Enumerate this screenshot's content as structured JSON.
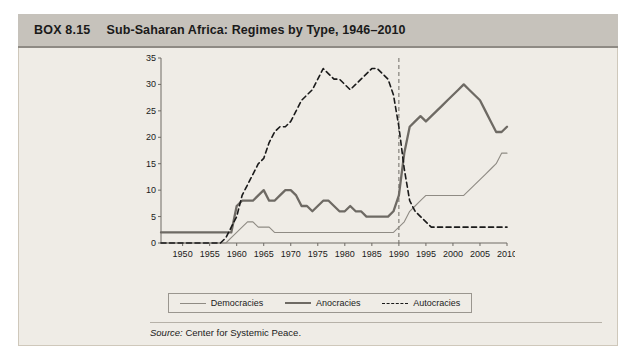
{
  "box": {
    "number": "BOX 8.15",
    "title": "Sub-Saharan Africa: Regimes by Type, 1946–2010"
  },
  "source": {
    "label": "Source:",
    "text": "Center for  Systemic Peace."
  },
  "legend": {
    "items": [
      {
        "label": "Democracies",
        "style": "thin-solid",
        "color": "#8f8b84"
      },
      {
        "label": "Anocracies",
        "style": "thick-solid",
        "color": "#6e6a64"
      },
      {
        "label": "Autocracies",
        "style": "dashed",
        "color": "#1a1a1a"
      }
    ]
  },
  "chart_data": {
    "type": "line",
    "title": "Sub-Saharan Africa: Regimes by Type, 1946–2010",
    "xlabel": "",
    "ylabel": "",
    "xlim": [
      1946,
      2010
    ],
    "ylim": [
      0,
      35
    ],
    "yticks": [
      0,
      5,
      10,
      15,
      20,
      25,
      30,
      35
    ],
    "xticks": [
      1950,
      1955,
      1960,
      1965,
      1970,
      1975,
      1980,
      1985,
      1990,
      1995,
      2000,
      2005,
      2010
    ],
    "grid": false,
    "legend_position": "bottom",
    "annotations": [
      {
        "type": "vertical-line",
        "x": 1990,
        "style": "dashed",
        "color": "#6e6a64"
      }
    ],
    "x": [
      1946,
      1947,
      1948,
      1949,
      1950,
      1951,
      1952,
      1953,
      1954,
      1955,
      1956,
      1957,
      1958,
      1959,
      1960,
      1961,
      1962,
      1963,
      1964,
      1965,
      1966,
      1967,
      1968,
      1969,
      1970,
      1971,
      1972,
      1973,
      1974,
      1975,
      1976,
      1977,
      1978,
      1979,
      1980,
      1981,
      1982,
      1983,
      1984,
      1985,
      1986,
      1987,
      1988,
      1989,
      1990,
      1991,
      1992,
      1993,
      1994,
      1995,
      1996,
      1997,
      1998,
      1999,
      2000,
      2001,
      2002,
      2003,
      2004,
      2005,
      2006,
      2007,
      2008,
      2009,
      2010
    ],
    "series": [
      {
        "name": "Democracies",
        "color": "#8f8b84",
        "style": "thin-solid",
        "values": [
          0,
          0,
          0,
          0,
          0,
          0,
          0,
          0,
          0,
          0,
          0,
          0,
          0,
          1,
          2,
          3,
          4,
          4,
          3,
          3,
          3,
          2,
          2,
          2,
          2,
          2,
          2,
          2,
          2,
          2,
          2,
          2,
          2,
          2,
          2,
          2,
          2,
          2,
          2,
          2,
          2,
          2,
          2,
          2,
          3,
          4,
          6,
          7,
          8,
          9,
          9,
          9,
          9,
          9,
          9,
          9,
          9,
          10,
          11,
          12,
          13,
          14,
          15,
          17,
          17
        ]
      },
      {
        "name": "Anocracies",
        "color": "#6e6a64",
        "style": "thick-solid",
        "values": [
          2,
          2,
          2,
          2,
          2,
          2,
          2,
          2,
          2,
          2,
          2,
          2,
          2,
          2,
          7,
          8,
          8,
          8,
          9,
          10,
          8,
          8,
          9,
          10,
          10,
          9,
          7,
          7,
          6,
          7,
          8,
          8,
          7,
          6,
          6,
          7,
          6,
          6,
          5,
          5,
          5,
          5,
          5,
          6,
          9,
          17,
          22,
          23,
          24,
          23,
          24,
          25,
          26,
          27,
          28,
          29,
          30,
          29,
          28,
          27,
          25,
          23,
          21,
          21,
          22
        ]
      },
      {
        "name": "Autocracies",
        "color": "#1a1a1a",
        "style": "dashed",
        "values": [
          0,
          0,
          0,
          0,
          0,
          0,
          0,
          0,
          0,
          0,
          0,
          0,
          1,
          3,
          5,
          9,
          11,
          13,
          15,
          16,
          19,
          21,
          22,
          22,
          23,
          25,
          27,
          28,
          29,
          31,
          33,
          32,
          31,
          31,
          30,
          29,
          30,
          31,
          32,
          33,
          33,
          32,
          31,
          28,
          22,
          14,
          8,
          6,
          5,
          4,
          3,
          3,
          3,
          3,
          3,
          3,
          3,
          3,
          3,
          3,
          3,
          3,
          3,
          3,
          3
        ]
      }
    ]
  }
}
